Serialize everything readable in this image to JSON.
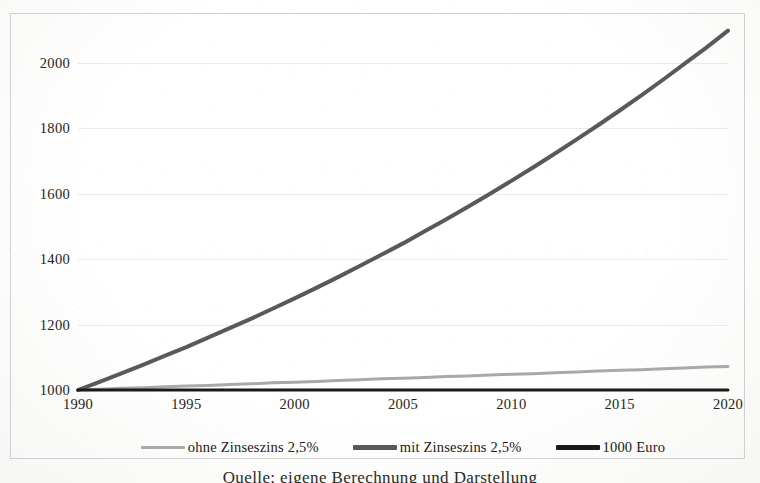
{
  "figure": {
    "caption": "Quelle: eigene Berechnung und Darstellung"
  },
  "legend": {
    "items": [
      {
        "label": "ohne Zinseszins 2,5%",
        "color": "#a9a9a9",
        "swatch_name": "legend-swatch-ohne-zinseszins"
      },
      {
        "label": "mit Zinseszins 2,5%",
        "color": "#595959",
        "swatch_name": "legend-swatch-mit-zinseszins"
      },
      {
        "label": "1000 Euro",
        "color": "#1a1a1a",
        "swatch_name": "legend-swatch-1000-euro"
      }
    ]
  },
  "chart_data": {
    "type": "line",
    "title": "",
    "subtitle": "",
    "xlabel": "",
    "ylabel": "",
    "xlim": [
      1990,
      2020
    ],
    "ylim": [
      1000,
      2100
    ],
    "grid": true,
    "grid_axis": "y",
    "legend_position": "bottom",
    "x_ticks": [
      "1990",
      "1995",
      "2000",
      "2005",
      "2010",
      "2015",
      "2020"
    ],
    "x_tick_values": [
      1990,
      1995,
      2000,
      2005,
      2010,
      2015,
      2020
    ],
    "y_ticks": [
      "1000",
      "1200",
      "1400",
      "1600",
      "1800",
      "2000"
    ],
    "y_tick_values": [
      1000,
      1200,
      1400,
      1600,
      1800,
      2000
    ],
    "x": [
      1990,
      1991,
      1992,
      1993,
      1994,
      1995,
      1996,
      1997,
      1998,
      1999,
      2000,
      2001,
      2002,
      2003,
      2004,
      2005,
      2006,
      2007,
      2008,
      2009,
      2010,
      2011,
      2012,
      2013,
      2014,
      2015,
      2016,
      2017,
      2018,
      2019,
      2020
    ],
    "series": [
      {
        "name": "ohne Zinseszins 2,5%",
        "color": "#a9a9a9",
        "width": 3,
        "values": [
          1000,
          1002,
          1005,
          1007,
          1010,
          1012,
          1014,
          1017,
          1019,
          1022,
          1024,
          1026,
          1029,
          1031,
          1034,
          1036,
          1038,
          1041,
          1043,
          1046,
          1048,
          1050,
          1053,
          1055,
          1058,
          1060,
          1062,
          1065,
          1067,
          1070,
          1072
        ]
      },
      {
        "name": "mit Zinseszins 2,5%",
        "color": "#595959",
        "width": 4,
        "values": [
          1000,
          1025,
          1051,
          1077,
          1104,
          1131,
          1160,
          1189,
          1218,
          1249,
          1280,
          1312,
          1345,
          1379,
          1413,
          1448,
          1485,
          1522,
          1560,
          1599,
          1639,
          1680,
          1722,
          1765,
          1809,
          1854,
          1900,
          1948,
          1997,
          2046,
          2098
        ]
      },
      {
        "name": "1000 Euro",
        "color": "#1a1a1a",
        "width": 3,
        "values": [
          1000,
          1000,
          1000,
          1000,
          1000,
          1000,
          1000,
          1000,
          1000,
          1000,
          1000,
          1000,
          1000,
          1000,
          1000,
          1000,
          1000,
          1000,
          1000,
          1000,
          1000,
          1000,
          1000,
          1000,
          1000,
          1000,
          1000,
          1000,
          1000,
          1000,
          1000
        ]
      }
    ]
  }
}
